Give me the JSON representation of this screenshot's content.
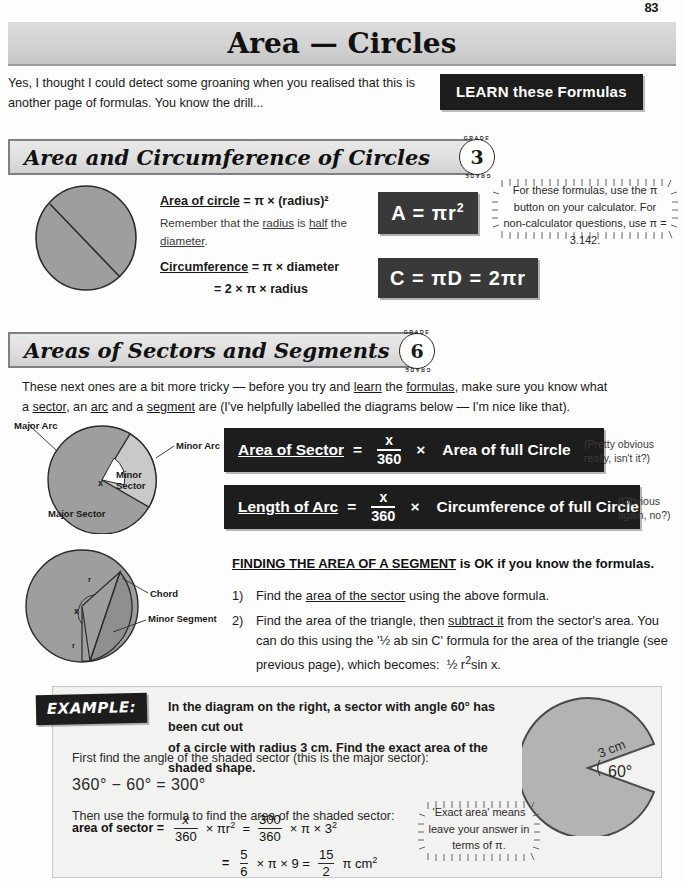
{
  "page": {
    "number": "83"
  },
  "title": {
    "text": "Area — Circles"
  },
  "intro": {
    "paragraph": "Yes, I thought I could detect some groaning when you realised that this is another page of formulas.  You know the drill...",
    "learn_box": "LEARN these Formulas"
  },
  "section1": {
    "heading": "Area and Circumference of Circles",
    "grade": {
      "number": "3",
      "arc_top": "GRADE",
      "arc_bottom": "GRADE"
    },
    "line1_label": "Area of circle",
    "line1_rest": " = π × (radius)²",
    "line2": "Remember that the radius is half the diameter.",
    "line2_underlines": [
      "radius",
      "half",
      "diameter"
    ],
    "line3_label": "Circumference",
    "line3_rest": " = π × diameter",
    "line4": "= 2 × π × radius",
    "formula_area": "A  =  πr",
    "formula_area_sup": "2",
    "formula_circ": "C  =  πD  =  2πr",
    "bubble": "For these formulas, use the π button on your calculator.  For non-calculator questions, use π = 3.142.",
    "diagram_labels": []
  },
  "section2": {
    "heading": "Areas of Sectors and Segments",
    "grade": {
      "number": "6",
      "arc_top": "GRADE",
      "arc_bottom": "GRADE"
    },
    "intro_line1": "These next ones are a bit more tricky — before you try and learn the formulas, make sure you know what",
    "intro_line2": "a sector, an arc and a segment are (I've helpfully labelled the diagrams below — I'm nice like that).",
    "sector_diagram": {
      "major_arc": "Major Arc",
      "minor_arc": "Minor Arc",
      "minor_sector": "Minor Sector",
      "major_sector": "Major Sector",
      "angle": "x"
    },
    "formula1": {
      "lead": "Area of Sector",
      "eq": "=",
      "numerator": "x",
      "denominator": "360",
      "times": "×",
      "tail": "Area of full Circle",
      "remark": "(Pretty obvious really, isn't it?)"
    },
    "formula2": {
      "lead": "Length of Arc",
      "eq": "=",
      "numerator": "x",
      "denominator": "360",
      "times": "×",
      "tail": "Circumference of full Circle",
      "remark": "(Obvious again, no?)"
    }
  },
  "segment": {
    "heading_underlined": "FINDING THE AREA OF A SEGMENT",
    "heading_rest": " is OK if you know the formulas.",
    "steps": [
      {
        "marker": "1)",
        "text": "Find the area of the sector using the above formula.",
        "underline": "area of the sector"
      },
      {
        "marker": "2)",
        "text": "Find the area of the triangle, then subtract it from the sector's area. You can do this using the '½ ab sin C' formula for the area of the triangle (see previous page), which becomes:  ½ r²sin x.",
        "underline": "subtract it"
      }
    ],
    "diagram_labels": {
      "chord": "Chord",
      "minor_segment": "Minor Segment",
      "angle": "x",
      "r1": "r",
      "r2": "r"
    }
  },
  "example": {
    "tag": "EXAMPLE:",
    "question_line1": "In the diagram on the right, a sector with angle 60° has been cut out",
    "question_line2": "of a circle with radius 3 cm.  Find the exact area of the shaded shape.",
    "step1_text": "First find the angle of the shaded sector (this is the major sector):",
    "step1_calc": "360° − 60° = 300°",
    "step2_text": "Then use the formula to find the area of the shaded sector:",
    "work_line1": {
      "label": "area of sector  =",
      "frac1_n": "x",
      "frac1_d": "360",
      "mid": "× πr²  =",
      "frac2_n": "300",
      "frac2_d": "360",
      "tail": "× π × 3²"
    },
    "work_line2": {
      "label": "=",
      "frac1_n": "5",
      "frac1_d": "6",
      "mid": "× π × 9  =",
      "frac2_n": "15",
      "frac2_d": "2",
      "tail": "π cm²"
    },
    "bubble": "'Exact area' means leave your answer in terms of π.",
    "diagram": {
      "radius_label": "3 cm",
      "angle_label": "60°"
    }
  },
  "colors": {
    "shape_fill": "#9a9a9a",
    "shape_fill_light": "#c4c4c4",
    "black_box": "#1d1d1d",
    "dark_box": "#393939",
    "banner": "#d6d6d6"
  }
}
